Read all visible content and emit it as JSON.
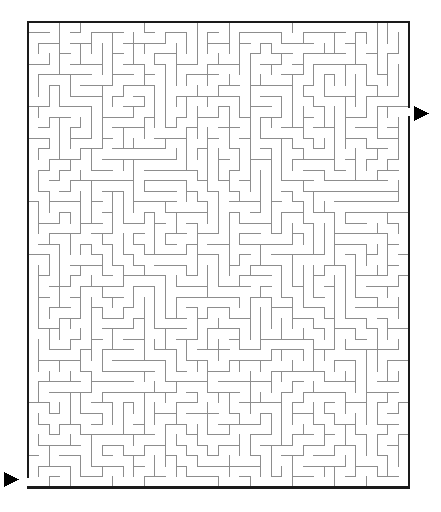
{
  "page": {
    "kind": "maze-puzzle",
    "width": 441,
    "height": 512,
    "background_color": "#ffffff"
  },
  "maze": {
    "title": "",
    "columns": 36,
    "rows": 44,
    "cell_size": 10.58,
    "origin_x": 28,
    "origin_y": 22,
    "maze_width": 381,
    "maze_height": 462,
    "border_color": "#1a1a1a",
    "border_thickness": 2.4,
    "wall_color": "#8d8d8d",
    "wall_thickness": 1,
    "path_color": "#ffffff",
    "seed": 20240917,
    "entrance": {
      "label": "entrance",
      "side": "left",
      "row": 43,
      "column": 0,
      "marker": "triangle-right",
      "marker_x": 4,
      "marker_y": 472,
      "marker_size": 15
    },
    "exit": {
      "label": "exit",
      "side": "right",
      "row": 8,
      "column": 35,
      "marker": "triangle-right",
      "marker_x": 414,
      "marker_y": 106,
      "marker_size": 15
    }
  }
}
